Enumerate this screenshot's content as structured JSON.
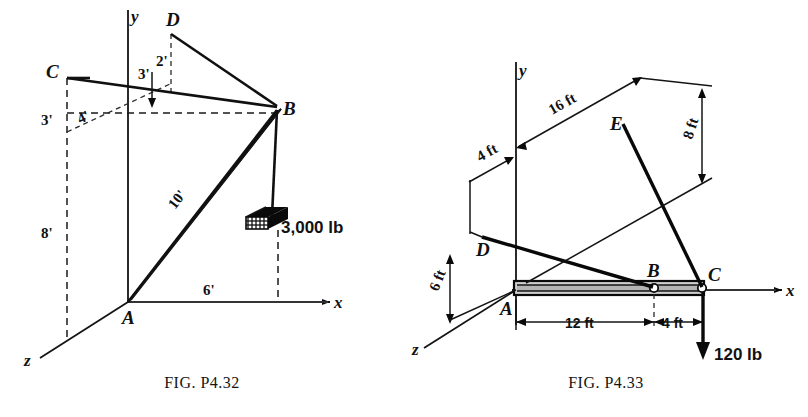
{
  "page": {
    "background": "#ffffff",
    "ink": "#111111",
    "width": 808,
    "height": 417
  },
  "figures": [
    {
      "id": "fig-p432",
      "caption_prefix": "F",
      "caption_small": "IG",
      "caption_rest": ". P4.32",
      "caption_full": "FIG. P4.32",
      "axes": [
        {
          "name": "y-axis",
          "label": "y"
        },
        {
          "name": "x-axis",
          "label": "x"
        },
        {
          "name": "z-axis",
          "label": "z"
        }
      ],
      "points": [
        {
          "name": "point-a",
          "label": "A"
        },
        {
          "name": "point-b",
          "label": "B"
        },
        {
          "name": "point-c",
          "label": "C"
        },
        {
          "name": "point-d",
          "label": "D"
        }
      ],
      "dimensions": [
        {
          "name": "dim-c-vertical",
          "label": "3'"
        },
        {
          "name": "dim-c-depth",
          "label": "4'"
        },
        {
          "name": "dim-a-height",
          "label": "8'"
        },
        {
          "name": "dim-d-offset",
          "label": "3'"
        },
        {
          "name": "dim-d-depth",
          "label": "2'"
        },
        {
          "name": "dim-strut-length",
          "label": "10'"
        },
        {
          "name": "dim-x-span",
          "label": "6'"
        }
      ],
      "load": {
        "name": "hanging-weight",
        "label": "3,000 lb"
      }
    },
    {
      "id": "fig-p433",
      "caption_prefix": "F",
      "caption_small": "IG",
      "caption_rest": ". P4.33",
      "caption_full": "FIG. P4.33",
      "axes": [
        {
          "name": "y-axis",
          "label": "y"
        },
        {
          "name": "x-axis",
          "label": "x"
        },
        {
          "name": "z-axis",
          "label": "z"
        }
      ],
      "points": [
        {
          "name": "point-a",
          "label": "A"
        },
        {
          "name": "point-b",
          "label": "B"
        },
        {
          "name": "point-c",
          "label": "C"
        },
        {
          "name": "point-d",
          "label": "D"
        },
        {
          "name": "point-e",
          "label": "E"
        }
      ],
      "dimensions": [
        {
          "name": "dim-e-offset",
          "label": "16 ft"
        },
        {
          "name": "dim-d-offset",
          "label": "4 ft"
        },
        {
          "name": "dim-e-height",
          "label": "8 ft"
        },
        {
          "name": "dim-d-depth",
          "label": "6 ft"
        },
        {
          "name": "dim-ab-span",
          "label": "12 ft"
        },
        {
          "name": "dim-bc-span",
          "label": "4 ft"
        }
      ],
      "load": {
        "name": "applied-load",
        "label": "120 lb"
      }
    }
  ]
}
